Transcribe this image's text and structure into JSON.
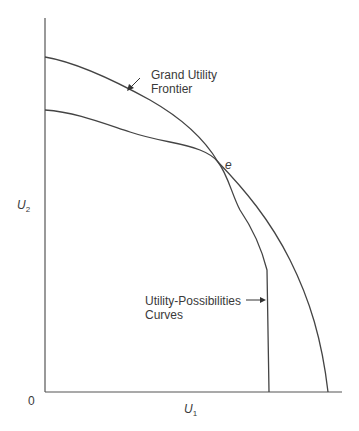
{
  "diagram": {
    "axes": {
      "origin_label": "0",
      "x_label": "U",
      "x_label_sub": "1",
      "y_label": "U",
      "y_label_sub": "2"
    },
    "annotations": {
      "grand_frontier_line1": "Grand Utility",
      "grand_frontier_line2": "Frontier",
      "possibilities_line1": "Utility-Possibilities",
      "possibilities_line2": "Curves",
      "point_e": "e"
    },
    "colors": {
      "line": "#444444",
      "text": "#3a3a3a"
    }
  }
}
